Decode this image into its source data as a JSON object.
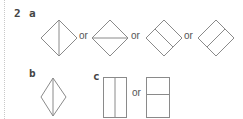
{
  "question": {
    "number": "2",
    "parts": [
      {
        "label": "a",
        "shapes": [
          "square-diamond-vertical-diagonal",
          "square-diamond-horizontal-diagonal",
          "square-diamond-midline-1",
          "square-diamond-midline-2"
        ],
        "connectors": [
          "or",
          "or",
          "or"
        ]
      },
      {
        "label": "b",
        "shapes": [
          "kite-vertical-diagonal"
        ]
      },
      {
        "label": "c",
        "shapes": [
          "rectangle-vertical-midline",
          "rectangle-horizontal-midline"
        ],
        "connectors": [
          "or"
        ]
      }
    ]
  },
  "colors": {
    "stroke": "#8a8a8a",
    "text": "#444444"
  }
}
